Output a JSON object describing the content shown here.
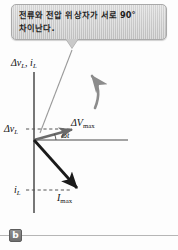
{
  "figure": {
    "label": "b",
    "kind": "phasor-diagram"
  },
  "callout": {
    "text": "전류와 전압 위상자가 서로 90°\n차이난다.",
    "background_color": "#cfcfcf",
    "border_color": "#a9a9a9",
    "text_color": "#1d1d1d"
  },
  "diagram": {
    "axis_top_label": "Δv",
    "axis_top_sub1": "L",
    "axis_top_sep": ", i",
    "axis_top_sub2": "L",
    "voltage_axis_label": "Δv",
    "voltage_axis_sub": "L",
    "current_axis_label": "i",
    "current_axis_sub": "L",
    "voltage_phasor_label": "ΔV",
    "voltage_phasor_sub": "max",
    "current_phasor_label": "I",
    "current_phasor_sub": "max",
    "angle_label": "ωt",
    "axis_color": "#4a4a4a",
    "phasor_color": "#1a1a1a",
    "dashed_color": "#555555",
    "pointer_color": "#8c8c8c",
    "origin_x": 34,
    "origin_y": 140,
    "voltage_phasor_tip_x": 74,
    "voltage_phasor_tip_y": 129,
    "current_phasor_tip_x": 79,
    "current_phasor_tip_y": 190,
    "angle_between_phasors_deg": 90
  }
}
